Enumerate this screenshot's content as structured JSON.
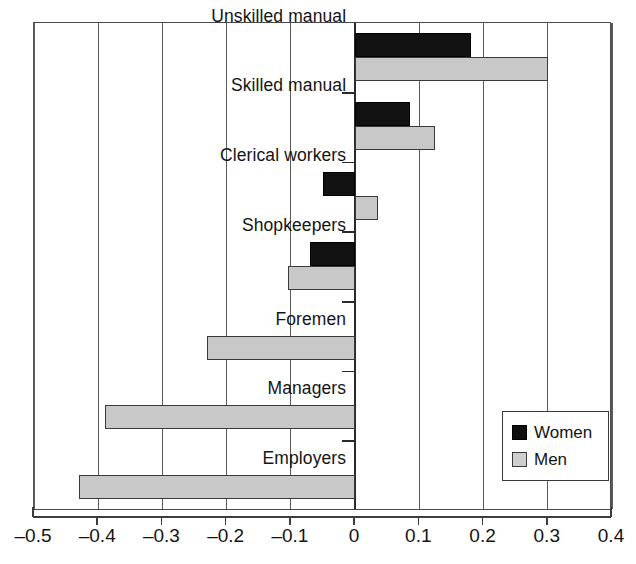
{
  "chart_data": {
    "type": "bar",
    "orientation": "horizontal",
    "title": "",
    "xlabel": "",
    "ylabel": "",
    "xlim": [
      -0.5,
      0.4
    ],
    "xticks": [
      -0.5,
      -0.4,
      -0.3,
      -0.2,
      -0.1,
      0,
      0.1,
      0.2,
      0.3,
      0.4
    ],
    "xticklabels": [
      "–0.5",
      "–0.4",
      "–0.3",
      "–0.2",
      "–0.1",
      "0",
      "0.1",
      "0.2",
      "0.3",
      "0.4"
    ],
    "grid": true,
    "grid_axis": "x",
    "legend_position": "lower right",
    "categories": [
      "Unskilled manual",
      "Skilled manual",
      "Clerical workers",
      "Shopkeepers",
      "Foremen",
      "Managers",
      "Employers"
    ],
    "series": [
      {
        "name": "Women",
        "color": "#121212",
        "values": [
          0.18,
          0.085,
          -0.05,
          -0.07,
          null,
          null,
          null
        ]
      },
      {
        "name": "Men",
        "color": "#c8c8c8",
        "values": [
          0.3,
          0.125,
          0.035,
          -0.105,
          -0.23,
          -0.39,
          -0.43
        ]
      }
    ]
  },
  "legend": {
    "entries": [
      {
        "label": "Women",
        "swatch": "black-square-icon"
      },
      {
        "label": "Men",
        "swatch": "gray-square-icon"
      }
    ]
  }
}
